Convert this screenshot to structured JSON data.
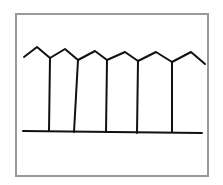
{
  "figure": {
    "frame_color": "#9a9a9a",
    "stroke_color": "#111111",
    "zigzag_points": [
      [
        24,
        57
      ],
      [
        37,
        47
      ],
      [
        50,
        58
      ],
      [
        65,
        49
      ],
      [
        78,
        60
      ],
      [
        95,
        51
      ],
      [
        107,
        60
      ],
      [
        125,
        52
      ],
      [
        138,
        61
      ],
      [
        156,
        52
      ],
      [
        172,
        62
      ],
      [
        191,
        52
      ],
      [
        205,
        64
      ]
    ],
    "posts": [
      {
        "x1": 50,
        "y1": 58,
        "x2": 49,
        "y2": 131
      },
      {
        "x1": 78,
        "y1": 60,
        "x2": 74,
        "y2": 132
      },
      {
        "x1": 107,
        "y1": 60,
        "x2": 106,
        "y2": 132
      },
      {
        "x1": 138,
        "y1": 61,
        "x2": 137,
        "y2": 133
      },
      {
        "x1": 172,
        "y1": 62,
        "x2": 172,
        "y2": 132
      }
    ],
    "ground_line": {
      "x1": 23,
      "y1": 131,
      "x2": 202,
      "y2": 133
    }
  }
}
